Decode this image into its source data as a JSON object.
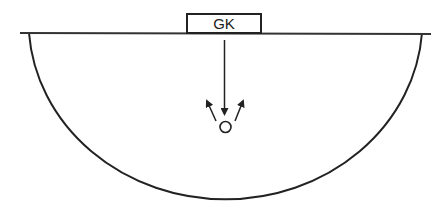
{
  "diagram": {
    "type": "sports-field-diagram",
    "goal_box": {
      "label": "GK"
    },
    "player_marker": {
      "shape": "circle"
    },
    "arrows": [
      {
        "from": "goalkeeper",
        "to": "player",
        "direction": "down"
      },
      {
        "from": "player",
        "direction": "up-left"
      },
      {
        "from": "player",
        "direction": "up-right"
      }
    ],
    "colors": {
      "stroke": "#222222",
      "background": "#ffffff"
    }
  }
}
